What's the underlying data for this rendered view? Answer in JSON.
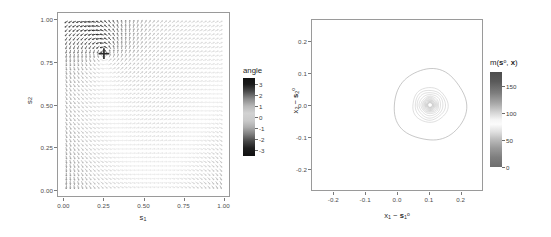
{
  "figure": {
    "background": "#ffffff",
    "panel_border_color": "#9a9a9a"
  },
  "left_panel": {
    "name": "angle-vector-field-panel",
    "marker": {
      "label": "cross-marker",
      "x": 0.25,
      "y": 0.8
    },
    "legend": {
      "title": "angle",
      "ticks": [
        "3",
        "2",
        "1",
        "0",
        "-1",
        "-2",
        "-3"
      ],
      "tick_values": [
        3,
        2,
        1,
        0,
        -1,
        -2,
        -3
      ],
      "orientation": "vertical",
      "colormap": "grey-cyclic"
    }
  },
  "right_panel": {
    "name": "m-contour-panel",
    "legend": {
      "title_prefix": "m(",
      "title_s": "s",
      "title_sup": "o",
      "title_mid": ", ",
      "title_x": "x",
      "title_suffix": ")",
      "ticks": [
        "150",
        "100",
        "50",
        "0"
      ],
      "tick_values": [
        150,
        100,
        50,
        0
      ],
      "orientation": "vertical",
      "colormap": "grey-diverging"
    }
  },
  "chart_data": [
    {
      "type": "heatmap",
      "name": "angle-vector-field",
      "title": "",
      "xlabel_parts": {
        "base": "s",
        "sub": "1"
      },
      "ylabel_parts": {
        "base": "s",
        "sub": "2"
      },
      "xlabel": "s1",
      "ylabel": "s2",
      "xlim": [
        -0.04,
        1.04
      ],
      "ylim": [
        -0.04,
        1.04
      ],
      "xticks": [
        0.0,
        0.25,
        0.5,
        0.75,
        1.0
      ],
      "xtick_labels": [
        "0.00",
        "0.25",
        "0.50",
        "0.75",
        "1.00"
      ],
      "yticks": [
        0.0,
        0.25,
        0.5,
        0.75,
        1.0
      ],
      "ytick_labels": [
        "0.00",
        "0.25",
        "0.50",
        "0.75",
        "1.00"
      ],
      "grid": false,
      "legend_position": "right-outside",
      "colorbar_label": "angle",
      "colorbar_range": [
        -3.141593,
        3.141593
      ],
      "colorbar_ticks": [
        3,
        2,
        1,
        0,
        -1,
        -2,
        -3
      ],
      "annotations": [
        {
          "kind": "cross",
          "x": 0.25,
          "y": 0.8,
          "label": "reference location s-ref"
        }
      ],
      "description": "Grid of small arrow glyphs (vector field) over the unit square; glyph darkness encodes the angle value from -3 to 3 radians. Dark arrows concentrate in the upper-left quadrant and along the right and upper edges; light/pale arrows fill the lower-left and central-lower regions.",
      "field_grid": {
        "nx": 40,
        "ny": 40,
        "x_start": 0.0,
        "x_end": 1.0,
        "y_start": 0.0,
        "y_end": 1.0
      },
      "source_point": {
        "x": 0.25,
        "y": 0.8
      }
    },
    {
      "type": "line",
      "name": "m-contour-plot",
      "title": "",
      "xlabel_parts": {
        "a_base": "x",
        "a_sub": "1",
        "minus": "−",
        "b_base": "s",
        "b_sub": "1",
        "b_sup": "o"
      },
      "ylabel_parts": {
        "a_base": "x",
        "a_sub": "2",
        "minus": "−",
        "b_base": "s",
        "b_sub": "2",
        "b_sup": "o"
      },
      "xlabel": "x1 - s1o",
      "ylabel": "x2 - s2o",
      "xlim": [
        -0.27,
        0.27
      ],
      "ylim": [
        -0.27,
        0.27
      ],
      "xticks": [
        -0.2,
        -0.1,
        0.0,
        0.1,
        0.2
      ],
      "xtick_labels": [
        "-0.2",
        "-0.1",
        "0.0",
        "0.1",
        "0.2"
      ],
      "yticks": [
        -0.2,
        -0.1,
        0.0,
        0.1,
        0.2
      ],
      "ytick_labels": [
        "-0.2",
        "-0.1",
        "0.0",
        "0.1",
        "0.2"
      ],
      "grid": false,
      "legend_position": "right-outside",
      "colorbar_label": "m(s°, x)",
      "colorbar_range": [
        0,
        175
      ],
      "colorbar_ticks": [
        150,
        100,
        50,
        0
      ],
      "center": {
        "x": 0.105,
        "y": 0.0
      },
      "description": "Nested near-circular contour lines of m(s-ref, x) centred at approximately (0.105, 0.00). One large faint outer ring of radius about 0.115 surrounds a cluster of tightly nested rings with radii decreasing from about 0.055 down to about 0.007.",
      "contour_radii": [
        0.115,
        0.056,
        0.048,
        0.041,
        0.034,
        0.028,
        0.024,
        0.021,
        0.018,
        0.016,
        0.014,
        0.012,
        0.0105,
        0.009,
        0.008,
        0.007
      ],
      "contour_color": "#bfbfbf"
    }
  ]
}
